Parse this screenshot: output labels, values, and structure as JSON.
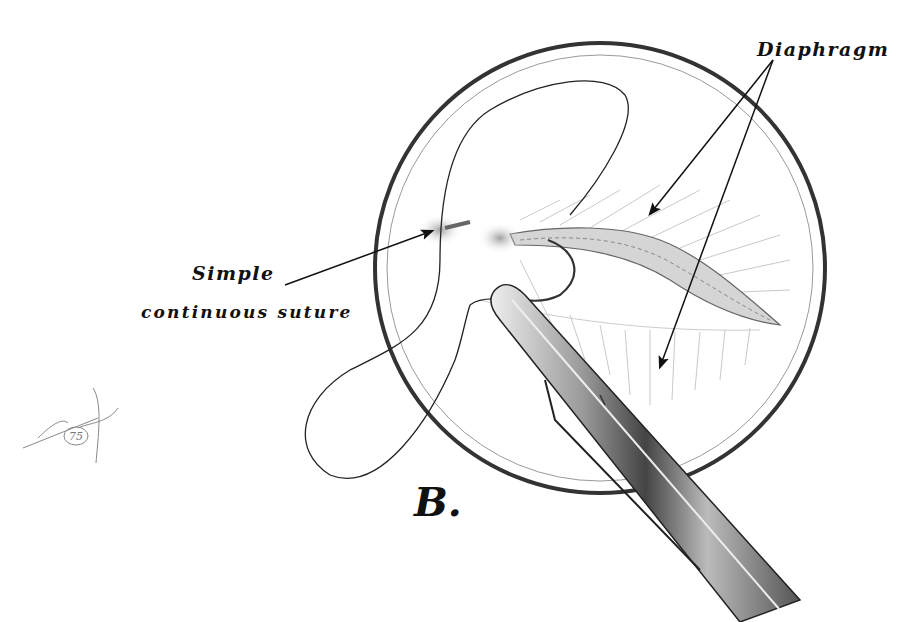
{
  "figure": {
    "panel_label": "B.",
    "labels": {
      "diaphragm": "Diaphragm",
      "suture_line1": "Simple",
      "suture_line2": "continuous suture"
    },
    "signature": {
      "name": "Lloyd E. Hosmer",
      "year": "75"
    },
    "depicted_objects": [
      "surgical-field-circle",
      "diaphragm-incision",
      "suture-thread",
      "curved-needle",
      "needle-holder-forceps",
      "label-arrows"
    ],
    "colors": {
      "ink": "#111111",
      "pencil": "#555555",
      "light_pencil": "#aaaaaa",
      "background": "#ffffff"
    }
  }
}
